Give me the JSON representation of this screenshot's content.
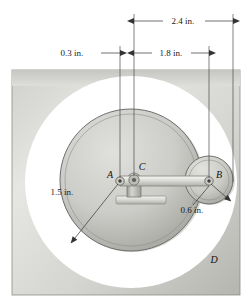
{
  "figure": {
    "units": "in.",
    "dimensions": [
      {
        "id": "dim-2-4",
        "label": "2.4 in.",
        "value": 2.4,
        "from": "C",
        "to": "outer-right",
        "orientation": "horizontal",
        "row": "top"
      },
      {
        "id": "dim-0-3",
        "label": "0.3 in.",
        "value": 0.3,
        "from": "A",
        "to": "C",
        "orientation": "horizontal",
        "row": "second"
      },
      {
        "id": "dim-1-8",
        "label": "1.8 in.",
        "value": 1.8,
        "from": "C",
        "to": "B",
        "orientation": "horizontal",
        "row": "second"
      },
      {
        "id": "dim-1-5",
        "label": "1.5 in.",
        "value": 1.5,
        "from": "A",
        "to": "big-disk-edge",
        "orientation": "radial-leader"
      },
      {
        "id": "dim-0-6",
        "label": "0.6 in.",
        "value": 0.6,
        "from": "B",
        "to": "small-disk-edge",
        "orientation": "radial-leader"
      }
    ],
    "points": [
      {
        "id": "A",
        "label": "A",
        "role": "pin-on-big-disk"
      },
      {
        "id": "B",
        "label": "B",
        "role": "pin-on-small-roller"
      },
      {
        "id": "C",
        "label": "C",
        "role": "fixed-pivot-bracket"
      },
      {
        "id": "D",
        "label": "D",
        "role": "ground-plate"
      }
    ],
    "colors": {
      "plate_light": "#e3e3e1",
      "plate_dark": "#b9b9b5",
      "disk_light": "#d8d8d4",
      "disk_dark": "#a9a9a4",
      "outline": "#6f6f6f",
      "bar": "#dedede",
      "background": "#ffffff",
      "text": "#1a1a1a"
    }
  }
}
